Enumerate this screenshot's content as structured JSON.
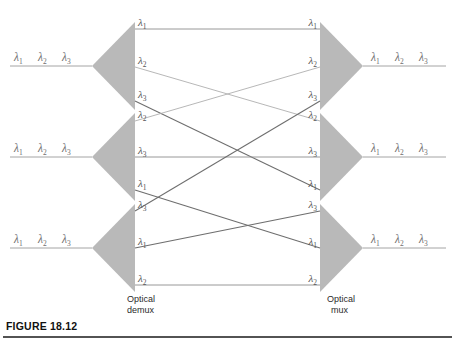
{
  "figure": {
    "caption": "FIGURE 18.12",
    "demux_label_line1": "Optical",
    "demux_label_line2": "demux",
    "mux_label_line1": "Optical",
    "mux_label_line2": "mux"
  },
  "colors": {
    "triangle_fill": "#b9b9b9",
    "wire": "#8c8c8c",
    "wire_strong": "#6e6e6e",
    "wire_faint": "#aaaaaa",
    "label_text": "#6b6b6b",
    "caption_text": "#111111",
    "device_text": "#2b2b2b",
    "rule": "#1a1a1a",
    "background": "#ffffff"
  },
  "lambda_symbol": "λ",
  "trunks": {
    "left": [
      {
        "id": "left-trunk-1",
        "labels": [
          "1",
          "2",
          "3"
        ],
        "y": 66
      },
      {
        "id": "left-trunk-2",
        "labels": [
          "1",
          "2",
          "3"
        ],
        "y": 157
      },
      {
        "id": "left-trunk-3",
        "labels": [
          "1",
          "2",
          "3"
        ],
        "y": 248
      }
    ],
    "right": [
      {
        "id": "right-trunk-1",
        "labels": [
          "1",
          "2",
          "3"
        ],
        "y": 66
      },
      {
        "id": "right-trunk-2",
        "labels": [
          "1",
          "2",
          "3"
        ],
        "y": 157
      },
      {
        "id": "right-trunk-3",
        "labels": [
          "1",
          "2",
          "3"
        ],
        "y": 248
      }
    ]
  },
  "demux_ports": [
    {
      "index": 0,
      "sub": "1",
      "y": 29,
      "group": 1
    },
    {
      "index": 1,
      "sub": "2",
      "y": 67,
      "group": 1
    },
    {
      "index": 2,
      "sub": "3",
      "y": 101,
      "group": 1
    },
    {
      "index": 3,
      "sub": "2",
      "y": 121,
      "group": 2
    },
    {
      "index": 4,
      "sub": "3",
      "y": 157,
      "group": 2
    },
    {
      "index": 5,
      "sub": "1",
      "y": 190,
      "group": 2
    },
    {
      "index": 6,
      "sub": "3",
      "y": 211,
      "group": 3
    },
    {
      "index": 7,
      "sub": "1",
      "y": 248,
      "group": 3
    },
    {
      "index": 8,
      "sub": "2",
      "y": 285,
      "group": 3
    }
  ],
  "mux_ports": [
    {
      "index": 0,
      "sub": "1",
      "y": 29,
      "group": 1
    },
    {
      "index": 1,
      "sub": "2",
      "y": 67,
      "group": 1
    },
    {
      "index": 2,
      "sub": "3",
      "y": 101,
      "group": 1
    },
    {
      "index": 3,
      "sub": "2",
      "y": 121,
      "group": 2
    },
    {
      "index": 4,
      "sub": "3",
      "y": 157,
      "group": 2
    },
    {
      "index": 5,
      "sub": "1",
      "y": 190,
      "group": 2
    },
    {
      "index": 6,
      "sub": "3",
      "y": 211,
      "group": 3
    },
    {
      "index": 7,
      "sub": "1",
      "y": 248,
      "group": 3
    },
    {
      "index": 8,
      "sub": "2",
      "y": 285,
      "group": 3
    }
  ],
  "routes": [
    {
      "id": "route-0",
      "from": 0,
      "to": 0,
      "weight": "normal"
    },
    {
      "id": "route-1",
      "from": 1,
      "to": 3,
      "weight": "faint"
    },
    {
      "id": "route-2",
      "from": 2,
      "to": 5,
      "weight": "strong"
    },
    {
      "id": "route-3",
      "from": 3,
      "to": 1,
      "weight": "faint"
    },
    {
      "id": "route-4",
      "from": 4,
      "to": 4,
      "weight": "normal"
    },
    {
      "id": "route-5",
      "from": 5,
      "to": 7,
      "weight": "strong"
    },
    {
      "id": "route-6",
      "from": 6,
      "to": 2,
      "weight": "strong"
    },
    {
      "id": "route-7",
      "from": 7,
      "to": 6,
      "weight": "strong"
    },
    {
      "id": "route-8",
      "from": 8,
      "to": 8,
      "weight": "normal"
    }
  ],
  "geometry": {
    "demux_base_x": 135,
    "demux_apex_x": 92,
    "mux_base_x": 320,
    "mux_apex_x": 363,
    "triangles": [
      {
        "id": "demux-1",
        "top": 22,
        "bottom": 110
      },
      {
        "id": "demux-2",
        "top": 113,
        "bottom": 201
      },
      {
        "id": "demux-3",
        "top": 204,
        "bottom": 292
      }
    ]
  }
}
